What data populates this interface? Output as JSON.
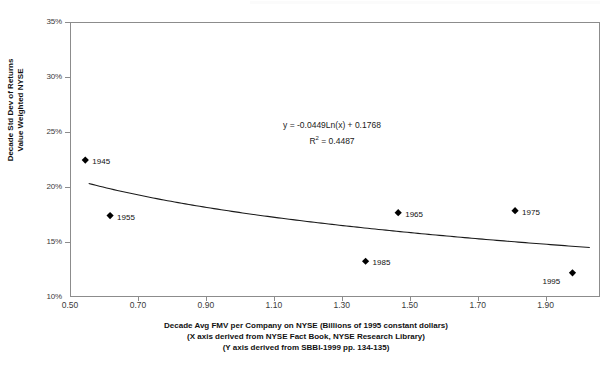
{
  "chart_data": {
    "type": "scatter",
    "title": "",
    "xlabel": "Decade Avg FMV per Company on NYSE (Billions of 1995 constant dollars)",
    "xlabel_note1": "(X axis derived from NYSE Fact Book, NYSE Research Library)",
    "xlabel_note2": "(Y axis derived from SBBI-1999 pp. 134-135)",
    "ylabel_line1": "Decade Std Dev of Returns",
    "ylabel_line2": "Value Weighted NYSE",
    "xlim": [
      0.5,
      2.06
    ],
    "ylim": [
      0.1,
      0.35
    ],
    "grid": false,
    "legend": "none",
    "xticks": [
      "0.50",
      "0.70",
      "0.90",
      "1.10",
      "1.30",
      "1.50",
      "1.70",
      "1.90"
    ],
    "xtick_values": [
      0.5,
      0.7,
      0.9,
      1.1,
      1.3,
      1.5,
      1.7,
      1.9
    ],
    "yticks": [
      "10%",
      "15%",
      "20%",
      "25%",
      "30%",
      "35%"
    ],
    "ytick_values": [
      0.1,
      0.15,
      0.2,
      0.25,
      0.3,
      0.35
    ],
    "points": [
      {
        "label": "1945",
        "x": 0.545,
        "y": 0.2245
      },
      {
        "label": "1955",
        "x": 0.618,
        "y": 0.174
      },
      {
        "label": "1965",
        "x": 1.466,
        "y": 0.1767
      },
      {
        "label": "1975",
        "x": 1.81,
        "y": 0.1785
      },
      {
        "label": "1985",
        "x": 1.37,
        "y": 0.1325
      },
      {
        "label": "1995",
        "x": 1.979,
        "y": 0.122
      }
    ],
    "trendline": {
      "type": "logarithmic",
      "equation": "y = -0.0449Ln(x) + 0.1768",
      "r_squared_label": "R",
      "r_squared_sup": "2",
      "r_squared_value": "= 0.4487",
      "slope": -0.0449,
      "intercept": 0.1768,
      "r_squared": 0.4487,
      "x_start": 0.555,
      "x_end": 2.03
    },
    "colors": {
      "marker": "#000000",
      "trendline": "#1a1a1a",
      "frame": "#8c8c8c",
      "text": "#111111",
      "background": "#ffffff"
    }
  }
}
